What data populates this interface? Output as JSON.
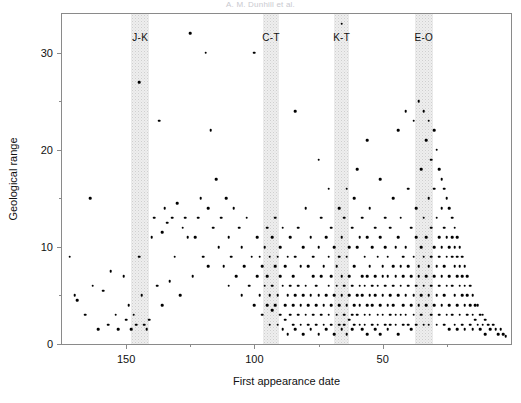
{
  "figure": {
    "running_head": "A. M. Dunhill et al.",
    "page_marker": ""
  },
  "chart_data": {
    "type": "scatter",
    "title": "",
    "xlabel": "First appearance date",
    "ylabel": "Geological range",
    "xlim": [
      175,
      0
    ],
    "ylim": [
      0,
      34
    ],
    "x_reversed": true,
    "grid": false,
    "legend": "none",
    "xticks": [
      150,
      100,
      50
    ],
    "xticks_minor": [
      125,
      75,
      25
    ],
    "yticks": [
      0,
      10,
      20,
      30
    ],
    "yticks_minor": [
      5,
      15,
      25
    ],
    "marker": {
      "shape": "circle",
      "color": "#000000",
      "size_px": 2.6
    },
    "bands": [
      {
        "label": "J-K",
        "center": 144.5,
        "start": 148.0,
        "end": 141.0,
        "color": "#eeeeee"
      },
      {
        "label": "C-T",
        "center": 93.5,
        "start": 96.5,
        "end": 90.5,
        "color": "#eeeeee"
      },
      {
        "label": "K-T",
        "center": 66.0,
        "start": 69.0,
        "end": 63.0,
        "color": "#eeeeee"
      },
      {
        "label": "E-O",
        "center": 34.0,
        "start": 37.5,
        "end": 30.5,
        "color": "#eeeeee"
      }
    ],
    "n_points": 404,
    "points": [
      [
        172,
        9
      ],
      [
        170,
        5
      ],
      [
        169,
        4.5
      ],
      [
        166,
        3
      ],
      [
        164,
        15
      ],
      [
        163,
        6
      ],
      [
        161,
        1.5
      ],
      [
        159,
        5.5
      ],
      [
        157,
        2
      ],
      [
        156,
        7.5
      ],
      [
        154,
        3
      ],
      [
        153,
        1.5
      ],
      [
        151,
        7
      ],
      [
        150,
        2.5
      ],
      [
        149,
        4
      ],
      [
        148,
        1.5
      ],
      [
        147,
        3
      ],
      [
        146,
        2
      ],
      [
        145,
        27
      ],
      [
        145,
        9
      ],
      [
        144,
        5
      ],
      [
        143,
        2
      ],
      [
        142,
        1.5
      ],
      [
        141,
        2.5
      ],
      [
        140,
        11
      ],
      [
        139,
        13
      ],
      [
        138,
        6
      ],
      [
        137,
        23
      ],
      [
        136,
        11.5
      ],
      [
        136,
        4
      ],
      [
        135,
        14
      ],
      [
        134,
        12.5
      ],
      [
        133,
        6.5
      ],
      [
        132,
        13
      ],
      [
        131,
        9
      ],
      [
        130,
        14.5
      ],
      [
        129,
        5
      ],
      [
        128,
        12
      ],
      [
        127,
        13
      ],
      [
        126,
        11
      ],
      [
        125,
        32
      ],
      [
        124,
        7
      ],
      [
        123,
        11
      ],
      [
        122,
        13
      ],
      [
        121,
        15
      ],
      [
        120,
        9
      ],
      [
        119,
        30
      ],
      [
        118,
        8
      ],
      [
        118,
        14
      ],
      [
        117,
        22
      ],
      [
        116,
        12
      ],
      [
        115,
        17
      ],
      [
        114,
        10
      ],
      [
        113,
        13
      ],
      [
        112,
        8
      ],
      [
        111,
        15
      ],
      [
        110,
        6
      ],
      [
        110,
        11
      ],
      [
        109,
        9
      ],
      [
        108,
        14
      ],
      [
        107,
        7
      ],
      [
        106,
        12
      ],
      [
        105,
        5
      ],
      [
        105,
        10
      ],
      [
        104,
        8
      ],
      [
        103,
        13
      ],
      [
        102,
        6
      ],
      [
        101,
        9
      ],
      [
        100,
        30
      ],
      [
        100,
        4
      ],
      [
        99,
        7
      ],
      [
        99,
        11
      ],
      [
        98,
        5
      ],
      [
        98,
        9
      ],
      [
        97,
        3
      ],
      [
        97,
        8
      ],
      [
        96,
        6
      ],
      [
        96,
        10
      ],
      [
        95,
        4
      ],
      [
        95,
        7
      ],
      [
        95,
        12
      ],
      [
        94,
        5
      ],
      [
        94,
        9
      ],
      [
        94,
        2
      ],
      [
        93,
        6
      ],
      [
        93,
        11
      ],
      [
        93,
        3.5
      ],
      [
        92,
        8
      ],
      [
        92,
        4
      ],
      [
        92,
        13
      ],
      [
        91,
        5
      ],
      [
        91,
        9
      ],
      [
        91,
        2
      ],
      [
        90,
        7
      ],
      [
        90,
        3
      ],
      [
        90,
        10
      ],
      [
        89,
        6
      ],
      [
        89,
        1.5
      ],
      [
        89,
        12
      ],
      [
        88,
        4
      ],
      [
        88,
        8
      ],
      [
        88,
        2.5
      ],
      [
        87,
        5
      ],
      [
        87,
        9
      ],
      [
        87,
        1
      ],
      [
        86,
        6
      ],
      [
        86,
        3
      ],
      [
        86,
        11
      ],
      [
        85,
        4
      ],
      [
        85,
        7
      ],
      [
        85,
        2
      ],
      [
        84,
        24
      ],
      [
        84,
        5
      ],
      [
        84,
        9
      ],
      [
        84,
        1.5
      ],
      [
        83,
        6
      ],
      [
        83,
        3
      ],
      [
        83,
        12
      ],
      [
        82,
        4
      ],
      [
        82,
        8
      ],
      [
        82,
        2
      ],
      [
        81,
        5
      ],
      [
        81,
        10
      ],
      [
        81,
        1
      ],
      [
        80,
        6
      ],
      [
        80,
        3
      ],
      [
        80,
        14
      ],
      [
        79,
        4
      ],
      [
        79,
        8
      ],
      [
        79,
        2
      ],
      [
        78,
        5
      ],
      [
        78,
        11
      ],
      [
        78,
        1.5
      ],
      [
        77,
        7
      ],
      [
        77,
        3
      ],
      [
        77,
        9
      ],
      [
        76,
        4
      ],
      [
        76,
        6
      ],
      [
        76,
        2
      ],
      [
        75,
        19
      ],
      [
        75,
        5
      ],
      [
        75,
        10
      ],
      [
        75,
        1
      ],
      [
        74,
        3
      ],
      [
        74,
        7
      ],
      [
        74,
        13
      ],
      [
        73,
        4
      ],
      [
        73,
        8
      ],
      [
        73,
        2
      ],
      [
        72,
        5
      ],
      [
        72,
        11
      ],
      [
        72,
        1.5
      ],
      [
        71,
        16
      ],
      [
        71,
        6
      ],
      [
        71,
        3
      ],
      [
        71,
        9
      ],
      [
        70,
        4
      ],
      [
        70,
        7
      ],
      [
        70,
        2
      ],
      [
        70,
        12
      ],
      [
        69,
        5
      ],
      [
        69,
        10
      ],
      [
        69,
        1
      ],
      [
        68,
        6
      ],
      [
        68,
        3
      ],
      [
        68,
        8
      ],
      [
        67,
        4
      ],
      [
        67,
        14
      ],
      [
        67,
        2
      ],
      [
        67,
        9
      ],
      [
        66,
        33
      ],
      [
        66,
        5
      ],
      [
        66,
        11
      ],
      [
        66,
        1.5
      ],
      [
        66,
        7
      ],
      [
        65,
        3
      ],
      [
        65,
        6
      ],
      [
        65,
        13
      ],
      [
        65,
        2
      ],
      [
        64,
        4
      ],
      [
        64,
        9
      ],
      [
        64,
        1
      ],
      [
        64,
        16
      ],
      [
        63,
        5
      ],
      [
        63,
        10
      ],
      [
        63,
        2.5
      ],
      [
        63,
        7
      ],
      [
        62,
        3
      ],
      [
        62,
        12
      ],
      [
        62,
        6
      ],
      [
        62,
        1.5
      ],
      [
        61,
        4
      ],
      [
        61,
        8
      ],
      [
        61,
        2
      ],
      [
        61,
        15
      ],
      [
        60,
        5
      ],
      [
        60,
        10
      ],
      [
        60,
        3
      ],
      [
        60,
        18
      ],
      [
        59,
        6
      ],
      [
        59,
        2
      ],
      [
        59,
        11
      ],
      [
        59,
        4
      ],
      [
        58,
        7
      ],
      [
        58,
        1.5
      ],
      [
        58,
        13
      ],
      [
        58,
        5
      ],
      [
        57,
        3
      ],
      [
        57,
        9
      ],
      [
        57,
        2
      ],
      [
        57,
        6
      ],
      [
        56,
        21
      ],
      [
        56,
        4
      ],
      [
        56,
        11
      ],
      [
        56,
        1
      ],
      [
        56,
        7
      ],
      [
        55,
        3
      ],
      [
        55,
        8
      ],
      [
        55,
        5
      ],
      [
        55,
        14
      ],
      [
        54,
        2
      ],
      [
        54,
        6
      ],
      [
        54,
        10
      ],
      [
        54,
        4
      ],
      [
        53,
        7
      ],
      [
        53,
        1.5
      ],
      [
        53,
        12
      ],
      [
        53,
        5
      ],
      [
        52,
        3
      ],
      [
        52,
        9
      ],
      [
        52,
        2
      ],
      [
        52,
        6
      ],
      [
        51,
        17
      ],
      [
        51,
        4
      ],
      [
        51,
        11
      ],
      [
        51,
        1
      ],
      [
        50,
        7
      ],
      [
        50,
        3
      ],
      [
        50,
        8
      ],
      [
        50,
        5
      ],
      [
        49,
        13
      ],
      [
        49,
        2
      ],
      [
        49,
        6
      ],
      [
        49,
        10
      ],
      [
        48,
        4
      ],
      [
        48,
        7
      ],
      [
        48,
        1.5
      ],
      [
        48,
        9
      ],
      [
        47,
        3
      ],
      [
        47,
        12
      ],
      [
        47,
        5
      ],
      [
        47,
        2
      ],
      [
        46,
        8
      ],
      [
        46,
        6
      ],
      [
        46,
        15
      ],
      [
        46,
        4
      ],
      [
        45,
        10
      ],
      [
        45,
        2
      ],
      [
        45,
        7
      ],
      [
        45,
        3
      ],
      [
        44,
        22
      ],
      [
        44,
        5
      ],
      [
        44,
        11
      ],
      [
        44,
        1
      ],
      [
        43,
        8
      ],
      [
        43,
        3
      ],
      [
        43,
        6
      ],
      [
        43,
        13
      ],
      [
        42,
        4
      ],
      [
        42,
        9
      ],
      [
        42,
        2
      ],
      [
        42,
        7
      ],
      [
        41,
        24
      ],
      [
        41,
        5
      ],
      [
        41,
        10
      ],
      [
        41,
        3
      ],
      [
        40,
        16
      ],
      [
        40,
        6
      ],
      [
        40,
        2
      ],
      [
        40,
        8
      ],
      [
        39,
        12
      ],
      [
        39,
        4
      ],
      [
        39,
        7
      ],
      [
        39,
        1.5
      ],
      [
        38,
        23
      ],
      [
        38,
        9
      ],
      [
        38,
        5
      ],
      [
        38,
        3
      ],
      [
        37,
        14
      ],
      [
        37,
        6
      ],
      [
        37,
        11
      ],
      [
        37,
        2
      ],
      [
        36,
        25
      ],
      [
        36,
        8
      ],
      [
        36,
        4
      ],
      [
        36,
        7
      ],
      [
        35,
        18
      ],
      [
        35,
        10
      ],
      [
        35,
        5
      ],
      [
        35,
        3
      ],
      [
        34,
        24
      ],
      [
        34,
        13
      ],
      [
        34,
        6
      ],
      [
        34,
        9
      ],
      [
        34,
        2
      ],
      [
        33,
        21
      ],
      [
        33,
        11
      ],
      [
        33,
        7
      ],
      [
        33,
        4
      ],
      [
        32,
        23
      ],
      [
        32,
        15
      ],
      [
        32,
        8
      ],
      [
        32,
        5
      ],
      [
        32,
        2
      ],
      [
        31,
        19
      ],
      [
        31,
        12
      ],
      [
        31,
        6
      ],
      [
        31,
        9
      ],
      [
        31,
        3
      ],
      [
        30,
        22
      ],
      [
        30,
        16
      ],
      [
        30,
        10
      ],
      [
        30,
        7
      ],
      [
        30,
        4
      ],
      [
        29,
        20
      ],
      [
        29,
        13
      ],
      [
        29,
        8
      ],
      [
        29,
        5
      ],
      [
        29,
        2
      ],
      [
        28,
        18
      ],
      [
        28,
        11
      ],
      [
        28,
        6
      ],
      [
        28,
        9
      ],
      [
        28,
        3
      ],
      [
        27,
        17
      ],
      [
        27,
        14
      ],
      [
        27,
        7
      ],
      [
        27,
        10
      ],
      [
        27,
        4
      ],
      [
        26,
        16
      ],
      [
        26,
        12
      ],
      [
        26,
        8
      ],
      [
        26,
        5
      ],
      [
        26,
        2
      ],
      [
        25,
        15
      ],
      [
        25,
        11
      ],
      [
        25,
        6
      ],
      [
        25,
        9
      ],
      [
        25,
        3
      ],
      [
        24,
        14
      ],
      [
        24,
        10
      ],
      [
        24,
        7
      ],
      [
        24,
        4
      ],
      [
        24,
        1.5
      ],
      [
        23,
        13
      ],
      [
        23,
        9
      ],
      [
        23,
        6
      ],
      [
        23,
        11
      ],
      [
        23,
        3
      ],
      [
        22,
        12
      ],
      [
        22,
        8
      ],
      [
        22,
        5
      ],
      [
        22,
        10
      ],
      [
        22,
        2
      ],
      [
        21,
        11
      ],
      [
        21,
        7
      ],
      [
        21,
        9
      ],
      [
        21,
        4
      ],
      [
        21,
        1.5
      ],
      [
        20,
        10
      ],
      [
        20,
        6
      ],
      [
        20,
        8
      ],
      [
        20,
        3
      ],
      [
        19,
        9
      ],
      [
        19,
        7
      ],
      [
        19,
        5
      ],
      [
        19,
        2
      ],
      [
        18,
        8
      ],
      [
        18,
        6
      ],
      [
        18,
        4
      ],
      [
        18,
        1.5
      ],
      [
        17,
        7
      ],
      [
        17,
        5
      ],
      [
        17,
        3
      ],
      [
        16,
        6
      ],
      [
        16,
        4
      ],
      [
        16,
        2
      ],
      [
        15,
        5
      ],
      [
        15,
        3
      ],
      [
        15,
        1.5
      ],
      [
        14,
        4
      ],
      [
        14,
        2.5
      ],
      [
        13,
        4
      ],
      [
        13,
        2
      ],
      [
        12,
        3
      ],
      [
        12,
        1.5
      ],
      [
        11,
        3
      ],
      [
        11,
        2
      ],
      [
        10,
        2.5
      ],
      [
        10,
        1
      ],
      [
        9,
        2
      ],
      [
        8,
        1.5
      ],
      [
        7,
        2
      ],
      [
        6,
        1.5
      ],
      [
        5,
        1
      ],
      [
        4,
        1.5
      ],
      [
        3,
        1
      ],
      [
        2,
        0.8
      ]
    ]
  }
}
